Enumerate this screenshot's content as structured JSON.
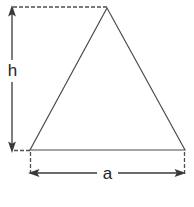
{
  "figure": {
    "kind": "geometry-diagram",
    "shape_name": "triangle",
    "canvas": {
      "width": 194,
      "height": 207,
      "background": "#ffffff"
    },
    "colors": {
      "stroke": "#3a3a3a",
      "shape_stroke": "#4a4a4a",
      "dashed_stroke": "#4f4f4f",
      "label_text": "#1e1e1e",
      "background": "#ffffff"
    },
    "stroke_width": 1.1,
    "triangle": {
      "apex": {
        "x": 107,
        "y": 8
      },
      "left_vertex": {
        "x": 30,
        "y": 150
      },
      "right_vertex": {
        "x": 185,
        "y": 150
      }
    },
    "dimensions": [
      {
        "id": "height",
        "label": "h",
        "orientation": "vertical",
        "axis_x": 12,
        "from_y": 8,
        "to_y": 150,
        "label_x": 12,
        "label_y": 71,
        "arrowheads": "both"
      },
      {
        "id": "base",
        "label": "a",
        "orientation": "horizontal",
        "axis_y": 173,
        "from_x": 30,
        "to_x": 185,
        "label_x": 107,
        "label_y": 174,
        "arrowheads": "both"
      }
    ],
    "extension_lines": [
      {
        "id": "top-extension",
        "orientation": "horizontal",
        "y": 7,
        "from_x": 13,
        "to_x": 107,
        "style": "dashed"
      },
      {
        "id": "bottom-left-tick",
        "orientation": "horizontal",
        "y": 150,
        "from_x": 14,
        "to_x": 30,
        "style": "dashed"
      },
      {
        "id": "left-extension",
        "orientation": "vertical",
        "x": 30,
        "from_y": 152,
        "to_y": 174,
        "style": "dashed"
      },
      {
        "id": "right-extension",
        "orientation": "vertical",
        "x": 185,
        "from_y": 152,
        "to_y": 174,
        "style": "dashed"
      }
    ],
    "dash_pattern": "4 2"
  }
}
